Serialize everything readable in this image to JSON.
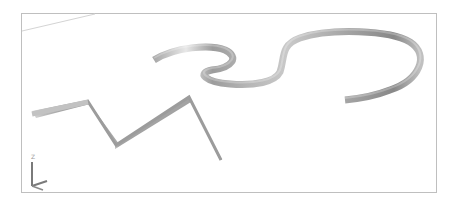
{
  "viewport": {
    "background": "#ffffff",
    "frame_color": "#bfbfbf",
    "ribbon_colors": {
      "light": "#e6e6e6",
      "mid": "#b8b8b8",
      "dark": "#8e8e8e"
    }
  },
  "objects": [
    {
      "name": "zigzag-ribbon",
      "type": "swept-surface"
    },
    {
      "name": "s-curve-ribbon",
      "type": "swept-surface"
    },
    {
      "name": "reference-line",
      "type": "line"
    }
  ],
  "ucs_icon": {
    "z_label": "Z"
  }
}
